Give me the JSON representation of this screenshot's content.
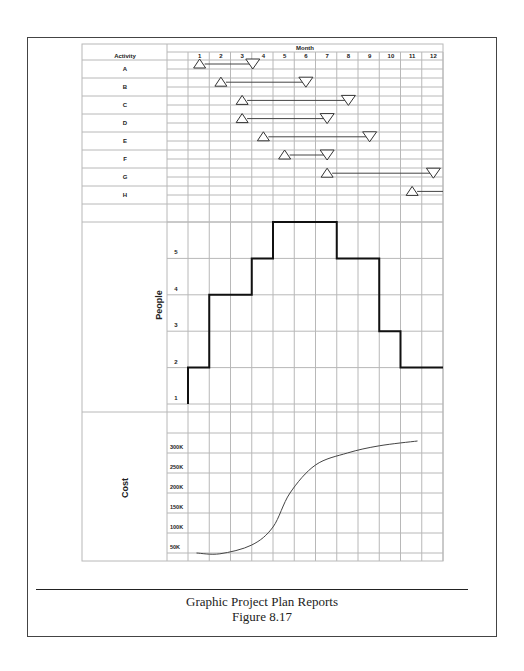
{
  "figure": {
    "caption_title": "Graphic Project Plan Reports",
    "caption_figure": "Figure 8.17"
  },
  "chart_data": [
    {
      "type": "table",
      "subtype": "gantt",
      "title": "Month",
      "row_header": "Activity",
      "months": [
        "1",
        "2",
        "3",
        "4",
        "5",
        "6",
        "7",
        "8",
        "9",
        "10",
        "11",
        "12"
      ],
      "activities": [
        {
          "name": "A",
          "start": 1,
          "end": 3.5
        },
        {
          "name": "B",
          "start": 2,
          "end": 6
        },
        {
          "name": "C",
          "start": 3,
          "end": 8
        },
        {
          "name": "D",
          "start": 3,
          "end": 7
        },
        {
          "name": "E",
          "start": 4,
          "end": 9
        },
        {
          "name": "F",
          "start": 5,
          "end": 7
        },
        {
          "name": "G",
          "start": 7,
          "end": 12
        },
        {
          "name": "H",
          "start": 11,
          "end": 12.5
        }
      ],
      "start_marker": "triangle-up",
      "end_marker": "triangle-down"
    },
    {
      "type": "line",
      "subtype": "step",
      "ylabel": "People",
      "yticks": [
        "1",
        "2",
        "3",
        "4",
        "5"
      ],
      "x": [
        0,
        1,
        2,
        3,
        4,
        5,
        6,
        7,
        8,
        9,
        10,
        11,
        12
      ],
      "values": [
        2,
        4,
        4,
        5,
        6,
        6,
        6,
        5,
        5,
        3,
        2,
        2
      ],
      "ylim": [
        1,
        6
      ],
      "grid": true
    },
    {
      "type": "line",
      "ylabel": "Cost",
      "yticks": [
        "50K",
        "100K",
        "150K",
        "200K",
        "250K",
        "300K"
      ],
      "x": [
        0.4,
        1.5,
        3,
        4,
        4.8,
        6,
        7.5,
        9,
        10.8
      ],
      "values": [
        50000,
        48000,
        70000,
        115000,
        200000,
        270000,
        300000,
        318000,
        330000
      ],
      "ylim": [
        50000,
        350000
      ],
      "grid": true
    }
  ]
}
